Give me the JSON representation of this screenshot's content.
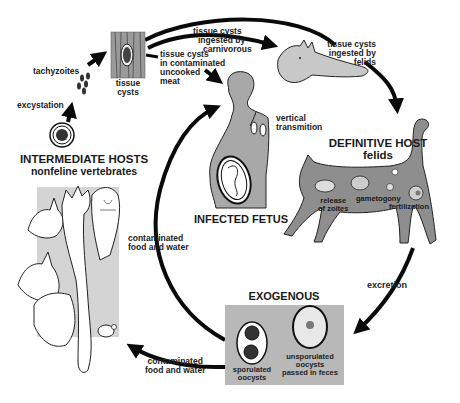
{
  "diagram": {
    "colors": {
      "arrow": "#0a0a0a",
      "silhouette": "#a8a8a8",
      "panel": "#b8b8b8",
      "background": "#ffffff"
    },
    "nodes": {
      "intermediate_hosts": {
        "title": "INTERMEDIATE HOSTS",
        "subtitle": "nonfeline vertebrates"
      },
      "definitive_host": {
        "title": "DEFINITIVE HOST",
        "subtitle": "felids"
      },
      "infected_fetus": {
        "title": "INFECTED FETUS"
      },
      "exogenous": {
        "title": "EXOGENOUS"
      },
      "tissue_cysts": {
        "label_line1": "tissue",
        "label_line2": "cysts"
      },
      "tachyzoites": {
        "label": "tachyzoites"
      },
      "sporulated_oocysts": {
        "line1": "sporulated",
        "line2": "oocysts"
      },
      "unsporulated_oocysts": {
        "line1": "unsporulated",
        "line2": "oocysts",
        "line3": "passed in feces"
      }
    },
    "cat_stages": {
      "release": {
        "line1": "release",
        "line2": "of zoites"
      },
      "gametogony": "gametogony",
      "fertilization": "fertilization"
    },
    "edges": {
      "excystation": "excystation",
      "carnivorous": {
        "line1": "tissue cysts",
        "line2": "ingested by",
        "line3": "carnivorous"
      },
      "uncooked_meat": {
        "line1": "tissue cysts",
        "line2": "in contaminated",
        "line3": "uncooked",
        "line4": "meat"
      },
      "felids": {
        "line1": "tissue cysts",
        "line2": "ingested by",
        "line3": "felids"
      },
      "vertical": {
        "line1": "vertical",
        "line2": "transmition"
      },
      "excretion": "excretion",
      "food_water_inner": {
        "line1": "contaminated",
        "line2": "food and water"
      },
      "food_water_outer": {
        "line1": "contaminated",
        "line2": "food and water"
      }
    },
    "icons": [
      "fox-icon",
      "cat-icon",
      "pregnant-woman-icon",
      "fetus-icon",
      "cyst-icon",
      "oocyst-icon",
      "animal-collage-icon",
      "mouse-icon"
    ]
  }
}
